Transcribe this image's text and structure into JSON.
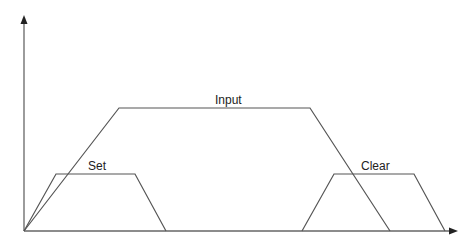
{
  "diagram": {
    "title": "",
    "labels": {
      "input": "Input",
      "set": "Set",
      "clear": "Clear"
    },
    "axes": {
      "x_arrow": true,
      "y_arrow": true
    },
    "shapes": [
      {
        "name": "Input",
        "type": "trapezoid",
        "points": [
          [
            24,
            231
          ],
          [
            119,
            108
          ],
          [
            310,
            108
          ],
          [
            390,
            231
          ]
        ]
      },
      {
        "name": "Set",
        "type": "trapezoid",
        "points": [
          [
            24,
            231
          ],
          [
            56,
            174
          ],
          [
            135,
            174
          ],
          [
            166,
            231
          ]
        ]
      },
      {
        "name": "Clear",
        "type": "trapezoid",
        "points": [
          [
            302,
            231
          ],
          [
            334,
            174
          ],
          [
            414,
            174
          ],
          [
            445,
            231
          ]
        ]
      }
    ],
    "colors": {
      "line": "#555555",
      "text": "#222222"
    }
  }
}
